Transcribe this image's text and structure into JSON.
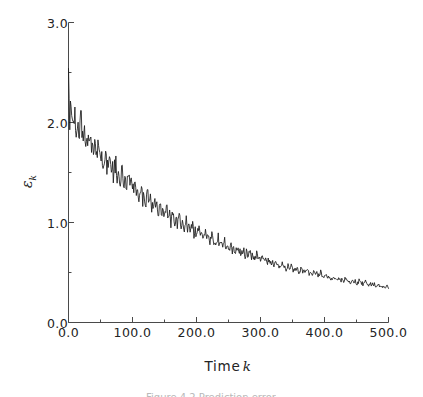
{
  "figure": {
    "background_color": "#ffffff",
    "line_color": "#1a1a1a",
    "axis_color": "#4a4a4a",
    "caption_partial": "Figure 4.2  Prediction error"
  },
  "axes": {
    "x_title_text": "Time",
    "x_title_var": "k",
    "y_title_symbol": "ε",
    "y_title_subscript": "k"
  },
  "chart_data": {
    "type": "line",
    "title": "",
    "xlabel": "Time k",
    "ylabel": "ε_k",
    "xlim": [
      0,
      500
    ],
    "ylim": [
      0,
      3
    ],
    "grid": false,
    "legend": null,
    "x_major_ticks": [
      0,
      100,
      200,
      300,
      400,
      500
    ],
    "x_major_tick_labels": [
      "0.0",
      "100.0",
      "200.0",
      "300.0",
      "400.0",
      "500.0"
    ],
    "x_minor_ticks": [
      50,
      150,
      250,
      350,
      450
    ],
    "y_major_ticks": [
      0,
      1,
      2,
      3
    ],
    "y_major_tick_labels": [
      "0.0",
      "1.0",
      "2.0",
      "3.0"
    ],
    "y_minor_ticks": [
      0.5,
      1.5,
      2.5
    ],
    "series": [
      {
        "name": "prediction error",
        "x_start": 0,
        "x_end": 500,
        "n_points": 251,
        "values": [
          2.44,
          2.02,
          2.24,
          2.03,
          1.95,
          2.06,
          1.9,
          2.0,
          1.88,
          1.97,
          2.05,
          1.86,
          1.95,
          1.82,
          1.9,
          1.78,
          1.86,
          1.92,
          1.74,
          1.83,
          1.71,
          1.79,
          1.66,
          1.74,
          1.8,
          1.63,
          1.7,
          1.58,
          1.66,
          1.72,
          1.55,
          1.62,
          1.69,
          1.52,
          1.59,
          1.47,
          1.55,
          1.61,
          1.44,
          1.51,
          1.4,
          1.47,
          1.53,
          1.38,
          1.45,
          1.34,
          1.41,
          1.47,
          1.33,
          1.39,
          1.28,
          1.35,
          1.41,
          1.27,
          1.33,
          1.23,
          1.29,
          1.35,
          1.22,
          1.28,
          1.18,
          1.24,
          1.3,
          1.17,
          1.22,
          1.13,
          1.19,
          1.24,
          1.12,
          1.17,
          1.08,
          1.13,
          1.19,
          1.07,
          1.12,
          1.04,
          1.09,
          1.14,
          1.03,
          1.08,
          1.0,
          1.05,
          1.1,
          0.99,
          1.04,
          0.96,
          1.01,
          1.06,
          0.96,
          1.0,
          0.93,
          0.97,
          1.02,
          0.92,
          0.96,
          0.89,
          0.93,
          0.98,
          0.89,
          0.93,
          0.86,
          0.9,
          0.94,
          0.85,
          0.89,
          0.83,
          0.87,
          0.91,
          0.83,
          0.86,
          0.8,
          0.84,
          0.88,
          0.8,
          0.83,
          0.78,
          0.81,
          0.85,
          0.77,
          0.81,
          0.75,
          0.78,
          0.82,
          0.75,
          0.78,
          0.73,
          0.76,
          0.79,
          0.72,
          0.75,
          0.7,
          0.73,
          0.76,
          0.7,
          0.73,
          0.68,
          0.71,
          0.74,
          0.67,
          0.7,
          0.66,
          0.68,
          0.71,
          0.65,
          0.68,
          0.63,
          0.66,
          0.69,
          0.63,
          0.65,
          0.61,
          0.64,
          0.66,
          0.61,
          0.63,
          0.59,
          0.62,
          0.64,
          0.59,
          0.61,
          0.57,
          0.6,
          0.62,
          0.57,
          0.59,
          0.56,
          0.58,
          0.6,
          0.55,
          0.57,
          0.54,
          0.56,
          0.58,
          0.54,
          0.56,
          0.52,
          0.54,
          0.56,
          0.52,
          0.54,
          0.51,
          0.53,
          0.55,
          0.51,
          0.52,
          0.49,
          0.51,
          0.53,
          0.49,
          0.51,
          0.48,
          0.5,
          0.51,
          0.47,
          0.49,
          0.46,
          0.48,
          0.5,
          0.46,
          0.48,
          0.45,
          0.47,
          0.48,
          0.45,
          0.46,
          0.44,
          0.45,
          0.47,
          0.44,
          0.45,
          0.42,
          0.44,
          0.45,
          0.42,
          0.44,
          0.41,
          0.43,
          0.44,
          0.41,
          0.42,
          0.4,
          0.41,
          0.43,
          0.4,
          0.41,
          0.39,
          0.4,
          0.42,
          0.39,
          0.4,
          0.38,
          0.39,
          0.41,
          0.38,
          0.39,
          0.37,
          0.38,
          0.39,
          0.37,
          0.38,
          0.36,
          0.37,
          0.38,
          0.36,
          0.37,
          0.35,
          0.36,
          0.37,
          0.35,
          0.36,
          0.35
        ]
      }
    ]
  }
}
